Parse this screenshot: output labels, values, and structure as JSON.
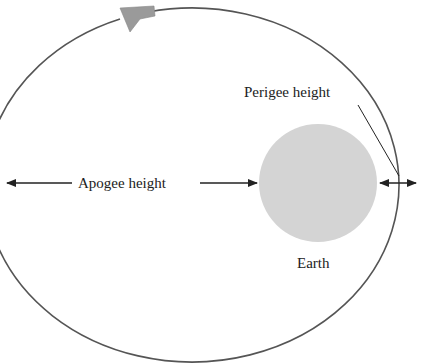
{
  "diagram": {
    "labels": {
      "apogee": "Apogee height",
      "perigee": "Perigee height",
      "earth": "Earth"
    },
    "colors": {
      "orbit": "#555555",
      "earth": "#d4d4d4",
      "satellite": "#9a9a9a",
      "text": "#222222"
    }
  }
}
